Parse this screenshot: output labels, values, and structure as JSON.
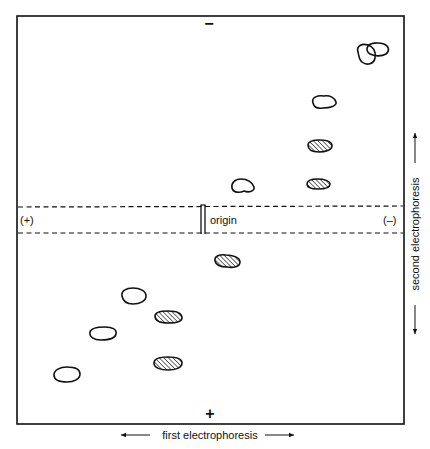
{
  "diagram": {
    "type": "two-dimensional electrophoresis map",
    "top_pole_label": "−",
    "bottom_pole_label": "+",
    "left_pole_label": "(+)",
    "right_pole_label": "(–)",
    "origin_label": "origin",
    "x_axis_label": "first electrophoresis",
    "y_axis_label": "second electrophoresis",
    "colors": {
      "ink": "#111111",
      "background": "#ffffff"
    },
    "spots": [
      {
        "id": "s1",
        "style": "open"
      },
      {
        "id": "s2",
        "style": "open"
      },
      {
        "id": "s3",
        "style": "open"
      },
      {
        "id": "s4",
        "style": "hatched"
      },
      {
        "id": "s5",
        "style": "hatched"
      },
      {
        "id": "s6",
        "style": "open"
      },
      {
        "id": "s7",
        "style": "hatched"
      },
      {
        "id": "s8",
        "style": "open"
      },
      {
        "id": "s9",
        "style": "hatched"
      },
      {
        "id": "s10",
        "style": "open"
      },
      {
        "id": "s11",
        "style": "hatched"
      },
      {
        "id": "s12",
        "style": "open"
      }
    ]
  }
}
